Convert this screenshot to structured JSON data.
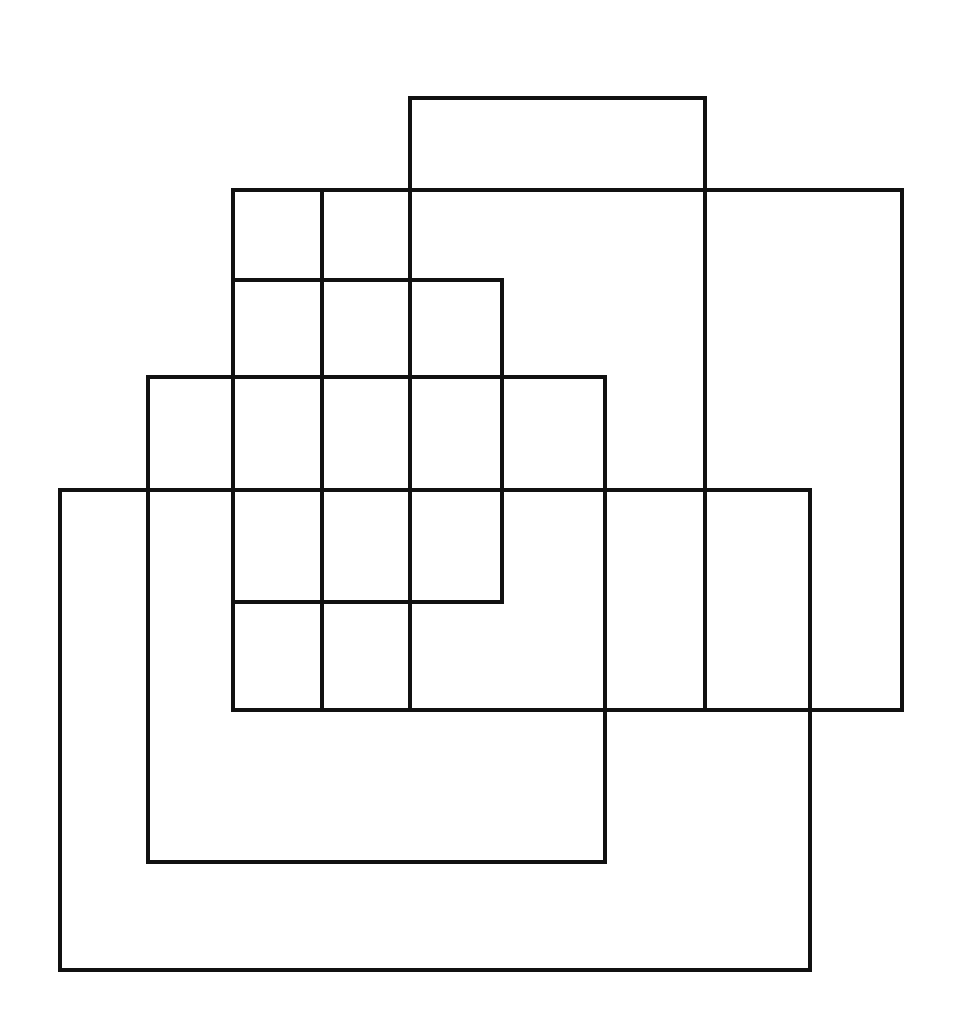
{
  "document": {
    "title": "Overlapping Rectangles Figure",
    "background_color": "#ffffff",
    "stroke_color": "#111111",
    "stroke_width": 4,
    "width": 956,
    "height": 1036,
    "description": "Five overlapping axis-aligned rectangles drawn in black outline on white paper, arranged in a descending staircase from upper right to lower left."
  },
  "chart_data": {
    "type": "diagram",
    "title": "",
    "xlabel": "",
    "ylabel": "",
    "grid": false,
    "legend": "none",
    "xlim": [
      0,
      956
    ],
    "ylim": [
      0,
      1036
    ],
    "shape_kind": "rectangle-outline",
    "shape_count": 5,
    "shapes": [
      {
        "name": "rect-a",
        "label": "A",
        "x": 410,
        "y": 98,
        "width": 295,
        "height": 612,
        "right": 705,
        "bottom": 710,
        "stroke": "#111111"
      },
      {
        "name": "rect-b",
        "label": "B",
        "x": 233,
        "y": 190,
        "width": 669,
        "height": 520,
        "right": 902,
        "bottom": 710,
        "stroke": "#111111"
      },
      {
        "name": "rect-c",
        "label": "C",
        "x": 233,
        "y": 280,
        "width": 269,
        "height": 322,
        "right": 502,
        "bottom": 602,
        "stroke": "#111111"
      },
      {
        "name": "rect-d",
        "label": "D",
        "x": 148,
        "y": 377,
        "width": 457,
        "height": 485,
        "right": 605,
        "bottom": 862,
        "stroke": "#111111"
      },
      {
        "name": "rect-e",
        "label": "E",
        "x": 60,
        "y": 490,
        "width": 750,
        "height": 480,
        "right": 810,
        "bottom": 970,
        "stroke": "#111111"
      }
    ],
    "extra_segments": [
      {
        "name": "inner-vertical-322",
        "orientation": "vertical",
        "x": 322,
        "y1": 190,
        "y2": 710
      }
    ]
  },
  "annotations": {
    "labels": [],
    "notes": []
  }
}
